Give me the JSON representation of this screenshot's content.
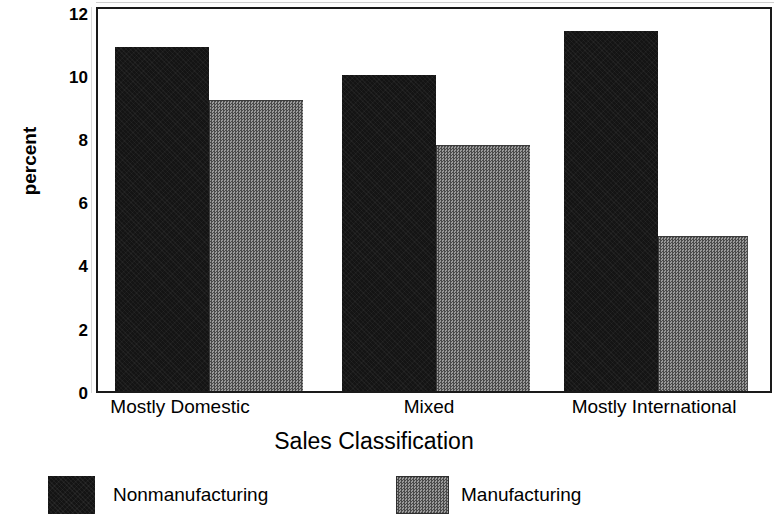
{
  "chart_data": {
    "type": "bar",
    "title": "",
    "xlabel": "Sales Classification",
    "ylabel": "percent",
    "categories": [
      "Mostly Domestic",
      "Mixed",
      "Mostly International"
    ],
    "series": [
      {
        "name": "Nonmanufacturing",
        "values": [
          10.9,
          10.0,
          11.4
        ],
        "color": "#141414"
      },
      {
        "name": "Manufacturing",
        "values": [
          9.2,
          7.8,
          4.9
        ],
        "color": "#6e6e6e"
      }
    ],
    "ylim": [
      0,
      12
    ],
    "yticks": [
      0,
      2,
      4,
      6,
      8,
      10,
      12
    ],
    "ytick_labels": [
      "0",
      "2",
      "4",
      "6",
      "8",
      "10",
      "12"
    ],
    "grid": false,
    "legend_position": "bottom",
    "frame": true
  },
  "axes": {
    "y_title": "percent",
    "x_title": "Sales Classification",
    "y_tick_labels": [
      "12",
      "10",
      "8",
      "6",
      "4",
      "2",
      "0"
    ],
    "x_tick_labels": [
      "Mostly Domestic",
      "Mixed",
      "Mostly International"
    ]
  },
  "legend": {
    "items": [
      {
        "label": "Nonmanufacturing",
        "swatch": "dark-solid-swatch"
      },
      {
        "label": "Manufacturing",
        "swatch": "gray-dither-swatch"
      }
    ]
  },
  "colors": {
    "nonmanufacturing": "#141414",
    "manufacturing": "#6e6e6e",
    "frame": "#1a1a1a",
    "background": "#ffffff"
  }
}
